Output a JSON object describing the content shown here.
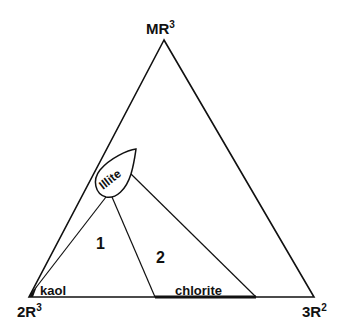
{
  "diagram": {
    "type": "ternary",
    "vertices": {
      "top": {
        "base": "MR",
        "sup": "3"
      },
      "left": {
        "base": "2R",
        "sup": "3"
      },
      "right": {
        "base": "3R",
        "sup": "2"
      }
    },
    "phases": {
      "illite": "Illite",
      "kaolinite": "kaol",
      "chlorite": "chlorite"
    },
    "fields": {
      "field1": "1",
      "field2": "2"
    },
    "colors": {
      "line": "#111111",
      "background": "#ffffff"
    }
  }
}
